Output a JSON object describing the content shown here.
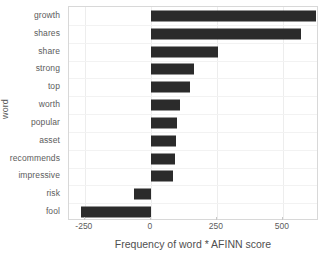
{
  "chart_data": {
    "type": "bar",
    "orientation": "horizontal",
    "title": "",
    "xlabel": "Frequency of word * AFINN score",
    "ylabel": "word",
    "categories": [
      "growth",
      "shares",
      "share",
      "strong",
      "top",
      "worth",
      "popular",
      "asset",
      "recommends",
      "impressive",
      "risk",
      "fool"
    ],
    "values": [
      625,
      570,
      255,
      165,
      150,
      110,
      100,
      95,
      90,
      85,
      -65,
      -265
    ],
    "xlim": [
      -310,
      637
    ],
    "xticks": [
      -250,
      0,
      250,
      500
    ],
    "xticklabels": [
      "-250",
      "0",
      "250",
      "500"
    ],
    "grid": true,
    "legend": null,
    "bar_color": "#2b2b2b",
    "background_color": "#ffffff",
    "axis_border_color": "#d8d8d8"
  }
}
